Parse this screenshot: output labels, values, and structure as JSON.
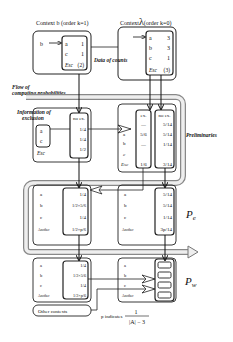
{
  "context_b": {
    "title": "Context b (order k=1)",
    "input_symbol": "b",
    "rows": [
      {
        "sym": "a",
        "count": "1"
      },
      {
        "sym": "c",
        "count": "1"
      }
    ],
    "esc_label": "Esc",
    "esc_count": "(2)"
  },
  "context_lambda": {
    "title_prefix": "Context",
    "title_symbol": "λ",
    "title_suffix": "(order k=0)",
    "rows": [
      {
        "sym": "a",
        "count": "3"
      },
      {
        "sym": "b",
        "count": "3"
      },
      {
        "sym": "c",
        "count": "1"
      }
    ],
    "esc_label": "Esc",
    "esc_count": "(3)"
  },
  "labels": {
    "data_of_counts": "Data of counts",
    "flow_line1": "Flow of",
    "flow_line2": "computing probabilities",
    "info_line1": "Information of",
    "info_line2": "exclusion",
    "preliminaries": "Preliminaries",
    "pe": "P",
    "pe_sub": "e",
    "pw": "P",
    "pw_sub": "w",
    "other_contexts": "Other contexts",
    "p_indicates": "p indicates",
    "frac_num": "1",
    "frac_den": "|A| − 3"
  },
  "prelim_left": {
    "excluded": [
      "a",
      "c"
    ],
    "esc": "Esc",
    "col_header": "no ex.",
    "values": [
      "1/4",
      "1/4",
      "1/2"
    ]
  },
  "prelim_right": {
    "syms": [
      "a",
      "b",
      "c",
      "Esc"
    ],
    "ex_header": "ex.",
    "ex_values": [
      "—",
      "5/6",
      "—",
      "1/6"
    ],
    "noex_header": "no ex.",
    "noex_values": [
      "5/14",
      "5/14",
      "1/14",
      "3/14"
    ]
  },
  "pe_left": {
    "syms": [
      "a",
      "b",
      "c",
      "Another"
    ],
    "values": [
      "1/4",
      "1/2×5/6",
      "1/4",
      "1/2×p/6"
    ]
  },
  "pe_right": {
    "syms": [
      "a",
      "b",
      "c",
      "Another"
    ],
    "values": [
      "5/14",
      "5/14",
      "1/14",
      "3p/14"
    ]
  },
  "pw_left": {
    "syms": [
      "a",
      "b",
      "c",
      "Another"
    ],
    "values": [
      "1/4",
      "1/2×5/6",
      "1/4",
      "1/2×p/6"
    ]
  },
  "pw_right": {
    "syms": [
      "a",
      "b",
      "c",
      "Another"
    ]
  }
}
